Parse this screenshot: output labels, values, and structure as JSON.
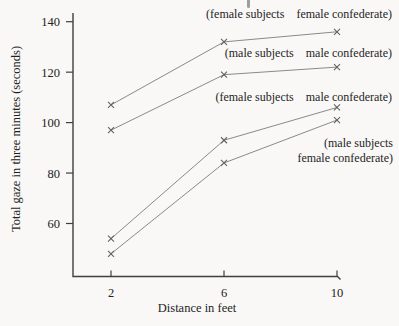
{
  "chart_data": {
    "type": "line",
    "title": "",
    "xlabel": "Distance in feet",
    "ylabel": "Total gaze in three minutes (seconds)",
    "x": [
      2,
      6,
      10
    ],
    "xticks": [
      "2",
      "6",
      "10"
    ],
    "yticks": [
      "60",
      "80",
      "100",
      "120",
      "140"
    ],
    "xlim": [
      0.65,
      10.1
    ],
    "ylim": [
      39,
      143
    ],
    "grid": false,
    "marker": "x",
    "legend_position": "inline-annotations",
    "line_color": "#8a8a8a",
    "marker_color": "#616161",
    "axis_color": "#3f3f3f",
    "text_color": "#222222",
    "background_color": "#f9f8f6",
    "series": [
      {
        "name": "female subjects - female confederate",
        "label_left": "(female subjects",
        "label_right": "female confederate)",
        "values": [
          107,
          132,
          136
        ]
      },
      {
        "name": "male subjects - male confederate",
        "label_left": "(male subjects",
        "label_right": "male confederate)",
        "values": [
          97,
          119,
          122
        ]
      },
      {
        "name": "female subjects - male confederate",
        "label_left": "(female subjects",
        "label_right": "male confederate)",
        "values": [
          54,
          93,
          106
        ]
      },
      {
        "name": "male subjects - female confederate",
        "label_left": "(male subjects",
        "label_right": "female confederate)",
        "values": [
          48,
          84,
          101
        ]
      }
    ]
  }
}
